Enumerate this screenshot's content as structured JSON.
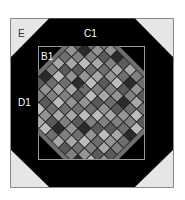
{
  "diagram": {
    "type": "quilt-block-layout",
    "labels": {
      "corner": "E",
      "top_border": "C1",
      "inner_corner": "B1",
      "side_border": "D1",
      "center_tile": "A"
    },
    "colors": {
      "background": "#ffffff",
      "outer_frame_stroke": "#8a8a8a",
      "corner_fill": "#e6e6e6",
      "border_fill": "#000000",
      "inner_frame_stroke": "#9a9a9a",
      "tile_outline": "#1a1a1a",
      "label_light": "#ffffff",
      "label_dark": "#333333"
    },
    "tile_shades": [
      "#3a3a3a",
      "#5a5a5a",
      "#6e6e6e",
      "#808080",
      "#949494",
      "#a8a8a8",
      "#bcbcbc",
      "#2a2a2a"
    ],
    "tile_pattern": [
      [
        3,
        5,
        2,
        4,
        7,
        1,
        5,
        3,
        2,
        6,
        4,
        1
      ],
      [
        6,
        2,
        4,
        1,
        3,
        5,
        2,
        7,
        4,
        1,
        3,
        5
      ],
      [
        1,
        7,
        3,
        5,
        2,
        4,
        6,
        1,
        3,
        5,
        2,
        4
      ],
      [
        4,
        3,
        6,
        2,
        5,
        1,
        3,
        4,
        7,
        2,
        6,
        1
      ],
      [
        2,
        5,
        1,
        4,
        6,
        3,
        5,
        2,
        1,
        4,
        3,
        6
      ],
      [
        5,
        1,
        4,
        7,
        2,
        6,
        1,
        4,
        5,
        3,
        2,
        7
      ],
      [
        3,
        6,
        2,
        5,
        1,
        4,
        2,
        6,
        3,
        1,
        5,
        2
      ],
      [
        7,
        2,
        5,
        3,
        4,
        2,
        6,
        3,
        1,
        6,
        4,
        3
      ],
      [
        1,
        4,
        3,
        6,
        2,
        5,
        1,
        7,
        4,
        2,
        5,
        1
      ],
      [
        6,
        3,
        1,
        2,
        5,
        3,
        4,
        2,
        6,
        3,
        1,
        4
      ],
      [
        2,
        5,
        6,
        4,
        1,
        7,
        3,
        5,
        2,
        4,
        6,
        2
      ],
      [
        4,
        1,
        3,
        5,
        6,
        2,
        5,
        1,
        3,
        7,
        2,
        5
      ]
    ]
  }
}
